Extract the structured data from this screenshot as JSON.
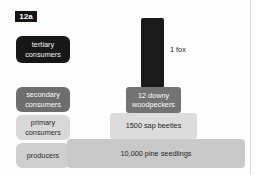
{
  "figure": {
    "badge": "12a"
  },
  "trophic_levels": [
    {
      "id": "tertiary",
      "label": "tertiary\nconsumers",
      "color": "#171717"
    },
    {
      "id": "secondary",
      "label": "secondary\nconsumers",
      "color": "#6e6e6e"
    },
    {
      "id": "primary",
      "label": "primary\nconsumers",
      "color": "#d8d8d8"
    },
    {
      "id": "producers",
      "label": "producers",
      "color": "#cfcfcf"
    }
  ],
  "chart_data": {
    "type": "bar",
    "title": "",
    "xlabel": "",
    "ylabel": "",
    "orientation": "pyramid-of-numbers",
    "categories": [
      "tertiary consumers",
      "secondary consumers",
      "primary consumers",
      "producers"
    ],
    "values": [
      1,
      12,
      1500,
      10000
    ],
    "bar_labels": [
      "1 fox",
      "12 downy\nwoodpeckers",
      "1500 sap beetles",
      "10,000 pine seedlings"
    ],
    "bar_colors": [
      "#1b1b1b",
      "#737373",
      "#dcdcdc",
      "#c9c9c9"
    ],
    "label_placement": [
      "outside-right",
      "inside",
      "inside",
      "inside"
    ],
    "grid": false,
    "legend": false
  }
}
